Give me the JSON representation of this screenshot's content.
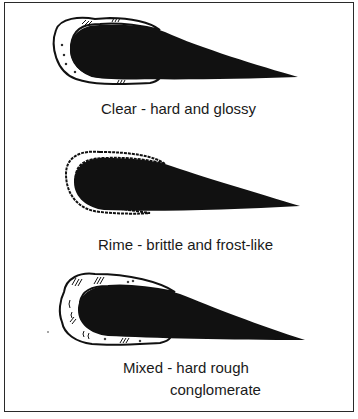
{
  "diagram": {
    "panels": [
      {
        "id": "clear",
        "caption": "Clear - hard and glossy"
      },
      {
        "id": "rime",
        "caption": "Rime - brittle and frost-like"
      },
      {
        "id": "mixed",
        "caption_line1": "Mixed - hard rough",
        "caption_line2": "conglomerate"
      }
    ],
    "colors": {
      "ink": "#111111",
      "border": "#2a2a2a",
      "background": "#ffffff"
    }
  }
}
